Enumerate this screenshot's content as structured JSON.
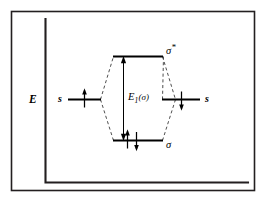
{
  "figure": {
    "kind": "molecular-orbital-energy-diagram",
    "axis": {
      "energy_label": "E"
    },
    "atomic_orbitals": [
      {
        "side": "left",
        "label": "s",
        "electron_spin": "up",
        "electron_glyph": "↑"
      },
      {
        "side": "right",
        "label": "s",
        "electron_spin": "down",
        "electron_glyph": "↓"
      }
    ],
    "molecular_orbitals": [
      {
        "name": "antibonding",
        "label_base": "σ",
        "label_superscript": "*",
        "label_full": "σ*",
        "electrons": 0
      },
      {
        "name": "bonding",
        "label_base": "σ",
        "label_superscript": "",
        "label_full": "σ",
        "electrons": 2,
        "electron_glyphs": [
          "↑",
          "↓"
        ]
      }
    ],
    "gap_annotation": {
      "symbol": "E",
      "subscript": "1",
      "argument": "(σ)",
      "full": "E₁(σ)"
    },
    "colors": {
      "ink": "#000000",
      "frame": "#231f20",
      "dashed": "#3a3a3a",
      "background": "#ffffff"
    }
  }
}
